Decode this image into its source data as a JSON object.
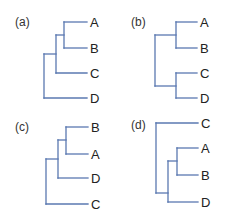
{
  "figure": {
    "colors": {
      "branch": "#5a78b0",
      "text": "#222222"
    },
    "panels": [
      {
        "id": "a",
        "label": "(a)",
        "topology": "(((A,B),C),D)",
        "leaves": [
          "A",
          "B",
          "C",
          "D"
        ]
      },
      {
        "id": "b",
        "label": "(b)",
        "topology": "((A,B),(C,D))",
        "leaves": [
          "A",
          "B",
          "C",
          "D"
        ]
      },
      {
        "id": "c",
        "label": "(c)",
        "topology": "(((B,A),D),C)",
        "leaves": [
          "B",
          "A",
          "D",
          "C"
        ]
      },
      {
        "id": "d",
        "label": "(d)",
        "topology": "(C,((A,B),D))",
        "leaves": [
          "C",
          "A",
          "B",
          "D"
        ]
      }
    ]
  }
}
